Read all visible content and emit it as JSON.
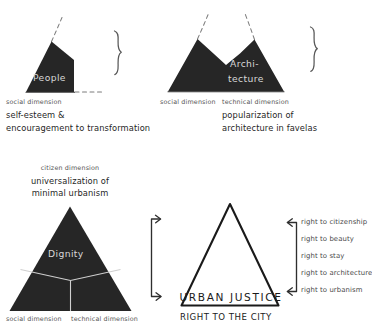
{
  "diagram": {
    "colors": {
      "fill_dark": "#262626",
      "shape_label": "#d8d8d8",
      "ink": "#1a1a1a",
      "muted_text": "#555555",
      "dashed": "#7d7d7d",
      "background": "#ffffff"
    }
  },
  "groups": {
    "people": {
      "shape_label": "People",
      "dimensions": [
        {
          "name": "social dimension"
        }
      ],
      "caption_lines": [
        "self-esteem &",
        "encouragement to transformation"
      ],
      "brace": "}"
    },
    "architecture": {
      "shape_label_line1": "Archi-",
      "shape_label_line2": "tecture",
      "dimensions": [
        {
          "name": "social dimension"
        },
        {
          "name": "technical dimension"
        }
      ],
      "caption_lines": [
        "popularization of",
        "architecture in favelas"
      ],
      "brace": "}"
    },
    "dignity": {
      "shape_label": "Dignity",
      "top_dimension": "citizen dimension",
      "top_caption_lines": [
        "universalization of",
        "minimal urbanism"
      ],
      "bottom_dimensions": [
        {
          "name": "social dimension"
        },
        {
          "name": "technical dimension"
        }
      ]
    },
    "urban_justice": {
      "inner_label": "URBAN  JUSTICE",
      "below_label": "RIGHT TO THE CITY",
      "rights": [
        "right to citizenship",
        "right to beauty",
        "right to stay",
        "right to architecture",
        "right to urbanism"
      ]
    }
  },
  "icons": {
    "brace_people": "right-curly-brace-icon",
    "brace_architecture": "right-curly-brace-icon",
    "connector_left": "double-arrow-bracket-right-icon",
    "connector_right": "double-arrow-bracket-left-icon"
  }
}
